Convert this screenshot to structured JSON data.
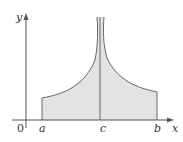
{
  "diagram": {
    "labels": {
      "y_axis": "y",
      "x_axis": "x",
      "origin": "0",
      "a": "a",
      "c": "c",
      "b": "b"
    },
    "colors": {
      "fill": "#e3e3e3",
      "curve": "#666666",
      "axis": "#555555"
    }
  }
}
